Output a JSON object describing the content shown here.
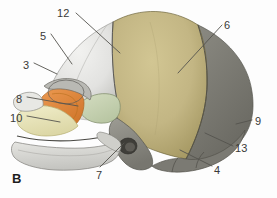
{
  "figure": {
    "panel_letter": "B",
    "background_color": "#fdfdfd"
  },
  "palette": {
    "frontal_bone": "#e4e4e2",
    "frontal_bone_shadow": "#c9c9c6",
    "parietal_bone": "#c3b684",
    "parietal_bone_shadow": "#a89b6c",
    "occipital_bone": "#807f78",
    "occipital_bone_dark": "#6a6962",
    "temporal_squama": "#c8d4b4",
    "sphenoid": "#e08840",
    "maxilla": "#ece8c0",
    "mandible": "#dcdcd8",
    "suture_line": "#4a4a46",
    "leader_line": "#55534e",
    "label_text": "#3a3a38"
  },
  "labels": [
    {
      "id": "12",
      "text": "12",
      "x": 57,
      "y": 8,
      "name": "label-12"
    },
    {
      "id": "5",
      "text": "5",
      "x": 40,
      "y": 31,
      "name": "label-5"
    },
    {
      "id": "3",
      "text": "3",
      "x": 23,
      "y": 60,
      "name": "label-3"
    },
    {
      "id": "6",
      "text": "6",
      "x": 224,
      "y": 20,
      "name": "label-6"
    },
    {
      "id": "8",
      "text": "8",
      "x": 16,
      "y": 94,
      "name": "label-8"
    },
    {
      "id": "10",
      "text": "10",
      "x": 10,
      "y": 113,
      "name": "label-10"
    },
    {
      "id": "9",
      "text": "9",
      "x": 255,
      "y": 116,
      "name": "label-9"
    },
    {
      "id": "13",
      "text": "13",
      "x": 235,
      "y": 143,
      "name": "label-13"
    },
    {
      "id": "4",
      "text": "4",
      "x": 214,
      "y": 165,
      "name": "label-4"
    },
    {
      "id": "7",
      "text": "7",
      "x": 96,
      "y": 170,
      "name": "label-7"
    }
  ],
  "panel_letter_position": {
    "x": 12,
    "y": 172
  }
}
